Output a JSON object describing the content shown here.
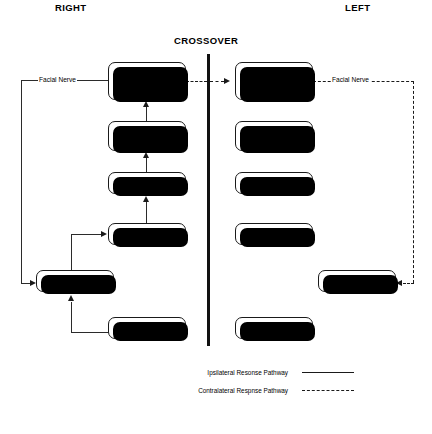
{
  "headers": {
    "right": "RIGHT",
    "left": "LEFT",
    "crossover": "CROSSOVER"
  },
  "diagram": {
    "right_column": [
      {
        "id": "right-superior-olivary-complex",
        "label": "Superior\nOlivary\nComplex"
      },
      {
        "id": "right-cochlear-nucleus",
        "label": "Cochlear\nNucleus"
      },
      {
        "id": "right-auditory-nerve",
        "label": "Auditory Nerve"
      },
      {
        "id": "right-inner-ear",
        "label": "Inner Ear"
      },
      {
        "id": "right-middle-ear",
        "label": "Middle Ear"
      },
      {
        "id": "right-outer-ear",
        "label": "Outer Ear"
      }
    ],
    "left_column": [
      {
        "id": "left-superior-olivary-complex",
        "label": "Superior\nOlivary\nComplex"
      },
      {
        "id": "left-cochlear-nucleus",
        "label": "Cochlear\nNucleus"
      },
      {
        "id": "left-auditory-nerve",
        "label": "Auditory Nerve"
      },
      {
        "id": "left-inner-ear",
        "label": "Inner Ear"
      },
      {
        "id": "left-middle-ear",
        "label": "Middle Ear"
      },
      {
        "id": "left-outer-ear",
        "label": "Outer Ear"
      }
    ],
    "edge_labels": {
      "right_facial_nerve": "Facial Nerve",
      "left_facial_nerve": "Facial Nerve"
    }
  },
  "legend": {
    "ipsilateral": "Ipsilateral Resonse Pathway",
    "contralateral": "Contralateral Respnse Pathway"
  },
  "colors": {
    "ink": "#1a1a1a",
    "background": "#ffffff"
  }
}
